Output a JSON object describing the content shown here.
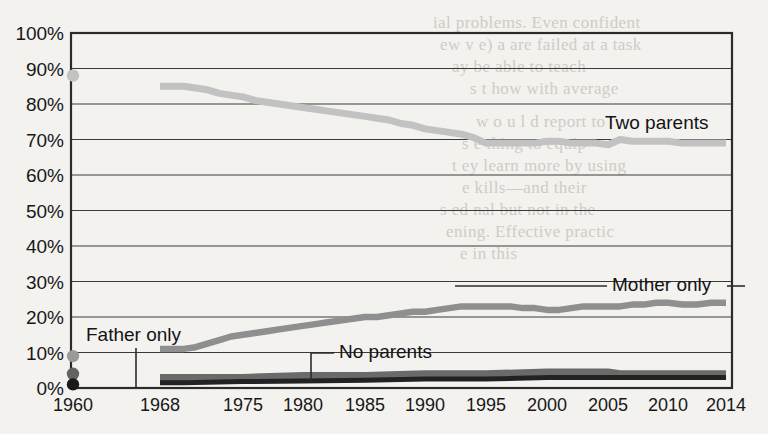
{
  "chart_data": {
    "type": "line",
    "title": "",
    "subtitle": "",
    "xlabel": "",
    "ylabel": "",
    "grid": true,
    "legend_position": "inline-annotations",
    "xlim": [
      1960,
      2014
    ],
    "ylim": [
      0,
      100
    ],
    "yticks": [
      "0%",
      "10%",
      "20%",
      "30%",
      "40%",
      "50%",
      "60%",
      "70%",
      "80%",
      "90%",
      "100%"
    ],
    "ytick_values": [
      0,
      10,
      20,
      30,
      40,
      50,
      60,
      70,
      80,
      90,
      100
    ],
    "xticks": [
      "1960",
      "1968",
      "1975",
      "1980",
      "1985",
      "1990",
      "1995",
      "2000",
      "2005",
      "2010",
      "2014"
    ],
    "xtick_values": [
      1960,
      1968,
      1975,
      1980,
      1985,
      1990,
      1995,
      2000,
      2005,
      2010,
      2014
    ],
    "series": [
      {
        "name": "Two parents",
        "color": "#c2c2c2",
        "label": "Two parents",
        "x": [
          1968,
          1969,
          1970,
          1971,
          1972,
          1973,
          1974,
          1975,
          1976,
          1977,
          1978,
          1979,
          1980,
          1981,
          1982,
          1983,
          1984,
          1985,
          1986,
          1987,
          1988,
          1989,
          1990,
          1991,
          1992,
          1993,
          1994,
          1995,
          1996,
          1997,
          1998,
          1999,
          2000,
          2001,
          2002,
          2003,
          2004,
          2005,
          2006,
          2007,
          2008,
          2009,
          2010,
          2011,
          2012,
          2013,
          2014
        ],
        "values": [
          85,
          85,
          85,
          84.5,
          84,
          83,
          82.5,
          82,
          81,
          80.5,
          80,
          79.5,
          79,
          78.5,
          78,
          77.5,
          77,
          76.5,
          76,
          75.5,
          74.5,
          74,
          73,
          72.5,
          72,
          71.5,
          70.5,
          69,
          69,
          69,
          69,
          69,
          69.5,
          69.5,
          69,
          69,
          69,
          68.5,
          70,
          69.5,
          69.5,
          69.5,
          69.5,
          69,
          69,
          69,
          69
        ]
      },
      {
        "name": "Mother only",
        "color": "#8f8f8f",
        "label": "Mother only",
        "x": [
          1968,
          1969,
          1970,
          1971,
          1972,
          1973,
          1974,
          1975,
          1976,
          1977,
          1978,
          1979,
          1980,
          1981,
          1982,
          1983,
          1984,
          1985,
          1986,
          1987,
          1988,
          1989,
          1990,
          1991,
          1992,
          1993,
          1994,
          1995,
          1996,
          1997,
          1998,
          1999,
          2000,
          2001,
          2002,
          2003,
          2004,
          2005,
          2006,
          2007,
          2008,
          2009,
          2010,
          2011,
          2012,
          2013,
          2014
        ],
        "values": [
          11,
          11,
          11,
          11.5,
          12.5,
          13.5,
          14.5,
          15,
          15.5,
          16,
          16.5,
          17,
          17.5,
          18,
          18.5,
          19,
          19.5,
          20,
          20,
          20.5,
          21,
          21.5,
          21.5,
          22,
          22.5,
          23,
          23,
          23,
          23,
          23,
          22.5,
          22.5,
          22,
          22,
          22.5,
          23,
          23,
          23,
          23,
          23.5,
          23.5,
          24,
          24,
          23.5,
          23.5,
          24,
          24
        ]
      },
      {
        "name": "Father only",
        "color": "#6a6a6a",
        "label": "Father only",
        "x": [
          1968,
          1970,
          1975,
          1980,
          1985,
          1990,
          1995,
          2000,
          2005,
          2006,
          2010,
          2014
        ],
        "values": [
          3,
          3,
          3,
          3.5,
          3.5,
          4,
          4,
          4.5,
          4.5,
          4,
          4,
          4
        ]
      },
      {
        "name": "No parents",
        "color": "#222222",
        "label": "No parents",
        "x": [
          1968,
          1970,
          1975,
          1980,
          1985,
          1990,
          1995,
          2000,
          2005,
          2010,
          2014
        ],
        "values": [
          1.5,
          1.5,
          1.8,
          2,
          2.2,
          2.5,
          2.5,
          3,
          3,
          3,
          3
        ]
      }
    ],
    "markers_1960": [
      {
        "series": "Two parents",
        "year": 1960,
        "value": 88,
        "color": "#c2c2c2"
      },
      {
        "series": "Mother only",
        "year": 1960,
        "value": 9,
        "color": "#9a9a9a"
      },
      {
        "series": "Father only",
        "year": 1960,
        "value": 4,
        "color": "#636363"
      },
      {
        "series": "No parents",
        "year": 1960,
        "value": 1,
        "color": "#1a1a1a"
      }
    ],
    "annotations": [
      {
        "name": "two-parents",
        "text": "Two parents",
        "x": 605,
        "y": 129
      },
      {
        "name": "mother-only",
        "text": "Mother only",
        "x": 612,
        "y": 291
      },
      {
        "name": "father-only",
        "text": "Father only",
        "x": 86,
        "y": 341
      },
      {
        "name": "no-parents",
        "text": "No parents",
        "x": 339,
        "y": 358
      }
    ]
  },
  "page_bleed": [
    {
      "text": "ial problems.  Even confident",
      "x": 433,
      "y": 13
    },
    {
      "text": "ew v e) a are failed at a task",
      "x": 440,
      "y": 35
    },
    {
      "text": "ay be able to teach",
      "x": 452,
      "y": 57
    },
    {
      "text": "s t         how with average",
      "x": 470,
      "y": 79
    },
    {
      "text": "w o u l d  report to",
      "x": 476,
      "y": 112
    },
    {
      "text": "s       e thing to equip",
      "x": 462,
      "y": 134
    },
    {
      "text": "t ey  learn more by using",
      "x": 452,
      "y": 156
    },
    {
      "text": "e         kills—and their",
      "x": 462,
      "y": 178
    },
    {
      "text": "s      ed nal but not in the",
      "x": 440,
      "y": 200
    },
    {
      "text": "ening. Effective practic",
      "x": 446,
      "y": 222
    },
    {
      "text": "e     in this",
      "x": 460,
      "y": 244
    }
  ]
}
